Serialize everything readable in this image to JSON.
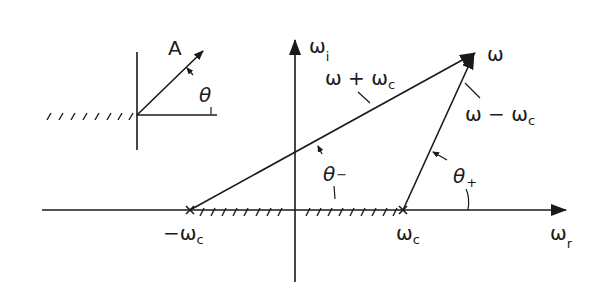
{
  "inset": {
    "vector_label": "A",
    "angle_label": "θ"
  },
  "axes": {
    "imag_label": "ω",
    "imag_sub": "i",
    "real_label": "ω",
    "real_sub": "r"
  },
  "points": {
    "neg_pole_label": "−ω",
    "neg_pole_sub": "c",
    "pos_pole_label": "ω",
    "pos_pole_sub": "c",
    "omega_label": "ω"
  },
  "vectors": {
    "sum_label_a": "ω + ω",
    "sum_label_sub": "c",
    "diff_label_a": "ω − ω",
    "diff_label_sub": "c"
  },
  "angles": {
    "theta_minus": "θ",
    "theta_minus_sub": "−",
    "theta_plus": "θ",
    "theta_plus_sub": "+"
  },
  "colors": {
    "ink": "#1a1a1a",
    "background": "#ffffff"
  }
}
